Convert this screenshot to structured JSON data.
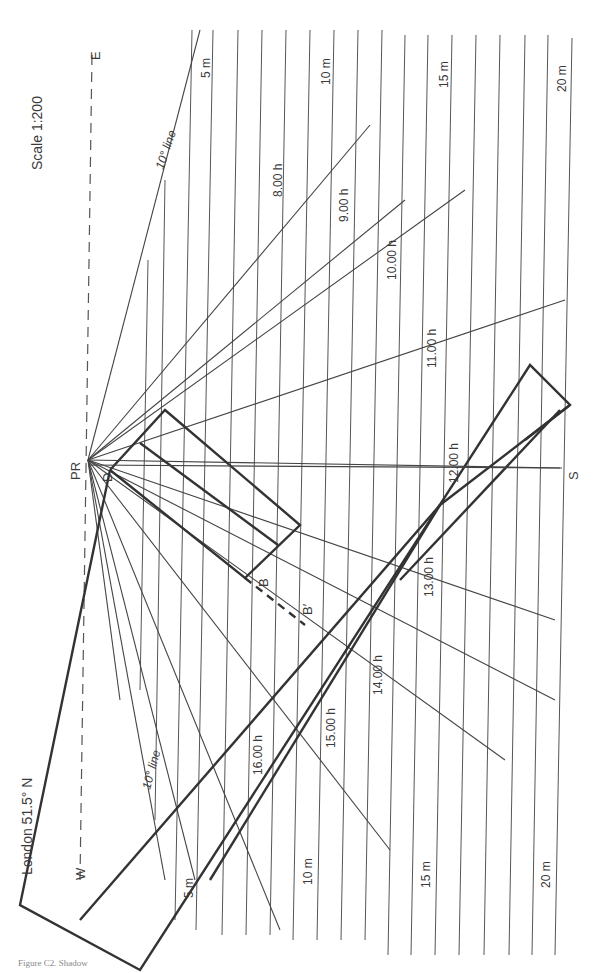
{
  "diagram": {
    "title": "London 51.5° N",
    "scale": "Scale 1:200",
    "origin_label": "PR",
    "compass": {
      "west": "W",
      "east": "E",
      "south": "S"
    },
    "points": {
      "d": "D",
      "b": "B",
      "b_prime": "B′"
    },
    "distance_labels_top": [
      "5 m",
      "10 m",
      "15 m",
      "20 m"
    ],
    "distance_labels_bottom": [
      "5 m",
      "10 m",
      "15 m",
      "20 m"
    ],
    "angle_lines": [
      "10° line",
      "10° line"
    ],
    "hour_labels": [
      "8.00 h",
      "9.00 h",
      "10.00 h",
      "11.00 h",
      "12.00 h",
      "13.00 h",
      "14.00 h",
      "15.00 h",
      "16.00 h"
    ],
    "caption": "Figure C2. Shadow"
  },
  "colors": {
    "ink": "#333333",
    "grid": "#555555",
    "paper": "#ffffff"
  }
}
